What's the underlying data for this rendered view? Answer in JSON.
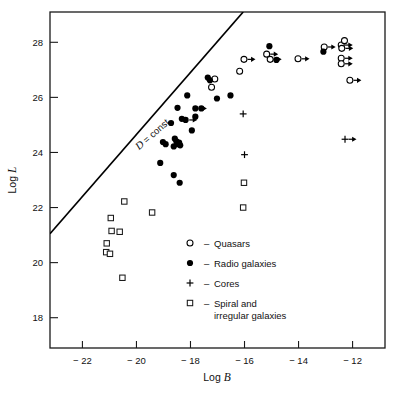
{
  "figure": {
    "background_color": "#ffffff",
    "ink_color": "#000000"
  },
  "chart_data": {
    "type": "scatter",
    "title": "",
    "subtitle": "",
    "xlabel": "Log B",
    "ylabel": "Log L",
    "xlim": [
      -23.2,
      -10.8
    ],
    "ylim": [
      16.9,
      29.1
    ],
    "grid": false,
    "xticks": [
      -22,
      -20,
      -18,
      -16,
      -14,
      -12
    ],
    "xtick_labels": [
      "− 22",
      "− 20",
      "− 18",
      "− 16",
      "− 14",
      "− 12"
    ],
    "yticks": [
      18,
      20,
      22,
      24,
      26,
      28
    ],
    "ytick_labels": [
      "18",
      "20",
      "22",
      "24",
      "26",
      "28"
    ],
    "legend_position": "center-bottom-inside",
    "annotations": [
      {
        "text": "D = const.",
        "text_italic_part": "D",
        "text_rest": "= const.",
        "rotation_deg": -41,
        "x": -19.3,
        "y": 24.6
      }
    ],
    "reference_line": {
      "label": "D = const.",
      "x_start": -23.2,
      "y_start": 21.05,
      "x_end": -16.05,
      "y_end": 29.1,
      "slope": 1.126
    },
    "legend": [
      {
        "key": "quasars",
        "marker": "open-circle",
        "dash": "–",
        "label": "Quasars"
      },
      {
        "key": "radio_galaxies",
        "marker": "filled-circle",
        "dash": "–",
        "label": "Radio galaxies"
      },
      {
        "key": "cores",
        "marker": "plus",
        "dash": "–",
        "label": "Cores"
      },
      {
        "key": "spiral_irregular",
        "marker": "open-square",
        "dash": "–",
        "label": "Spiral and",
        "label_line2": "irregular galaxies"
      }
    ],
    "series": [
      {
        "name": "Quasars",
        "marker": "open-circle",
        "points": [
          {
            "x": -16.18,
            "y": 26.95,
            "arrow": false
          },
          {
            "x": -17.1,
            "y": 26.67,
            "arrow": false
          },
          {
            "x": -17.22,
            "y": 26.37,
            "arrow": false
          },
          {
            "x": -15.18,
            "y": 27.57,
            "arrow": true
          },
          {
            "x": -15.05,
            "y": 27.38,
            "arrow": true
          },
          {
            "x": -16.02,
            "y": 27.38,
            "arrow": true
          },
          {
            "x": -14.02,
            "y": 27.4,
            "arrow": true
          },
          {
            "x": -13.05,
            "y": 27.83,
            "arrow": true
          },
          {
            "x": -12.42,
            "y": 27.9,
            "arrow": true
          },
          {
            "x": -12.3,
            "y": 28.06,
            "arrow": false
          },
          {
            "x": -12.4,
            "y": 27.78,
            "arrow": true
          },
          {
            "x": -12.42,
            "y": 27.42,
            "arrow": true
          },
          {
            "x": -12.42,
            "y": 27.22,
            "arrow": true
          },
          {
            "x": -12.1,
            "y": 26.62,
            "arrow": true
          }
        ]
      },
      {
        "name": "Radio galaxies",
        "marker": "filled-circle",
        "points": [
          {
            "x": -17.36,
            "y": 26.72,
            "arrow": false
          },
          {
            "x": -17.28,
            "y": 26.62,
            "arrow": false
          },
          {
            "x": -17.02,
            "y": 25.96,
            "arrow": false
          },
          {
            "x": -16.52,
            "y": 26.07,
            "arrow": false
          },
          {
            "x": -18.12,
            "y": 26.07,
            "arrow": false
          },
          {
            "x": -18.48,
            "y": 25.62,
            "arrow": false
          },
          {
            "x": -17.82,
            "y": 25.6,
            "arrow": true
          },
          {
            "x": -17.6,
            "y": 25.6,
            "arrow": false
          },
          {
            "x": -18.32,
            "y": 25.22,
            "arrow": false
          },
          {
            "x": -18.18,
            "y": 25.18,
            "arrow": true
          },
          {
            "x": -17.82,
            "y": 25.3,
            "arrow": false
          },
          {
            "x": -18.72,
            "y": 25.07,
            "arrow": false
          },
          {
            "x": -17.95,
            "y": 24.8,
            "arrow": false
          },
          {
            "x": -18.58,
            "y": 24.5,
            "arrow": false
          },
          {
            "x": -18.52,
            "y": 24.4,
            "arrow": false
          },
          {
            "x": -18.48,
            "y": 24.3,
            "arrow": false
          },
          {
            "x": -18.62,
            "y": 24.22,
            "arrow": false
          },
          {
            "x": -18.42,
            "y": 24.36,
            "arrow": false
          },
          {
            "x": -18.38,
            "y": 24.26,
            "arrow": false
          },
          {
            "x": -19.02,
            "y": 24.38,
            "arrow": false
          },
          {
            "x": -18.92,
            "y": 24.3,
            "arrow": false
          },
          {
            "x": -19.12,
            "y": 23.62,
            "arrow": false
          },
          {
            "x": -18.62,
            "y": 23.18,
            "arrow": false
          },
          {
            "x": -18.4,
            "y": 22.9,
            "arrow": false
          },
          {
            "x": -14.82,
            "y": 27.36,
            "arrow": false
          },
          {
            "x": -13.08,
            "y": 27.66,
            "arrow": false
          },
          {
            "x": -15.08,
            "y": 27.86,
            "arrow": false
          }
        ]
      },
      {
        "name": "Cores",
        "marker": "plus",
        "points": [
          {
            "x": -16.05,
            "y": 25.4,
            "arrow": false
          },
          {
            "x": -16.0,
            "y": 23.92,
            "arrow": false
          },
          {
            "x": -12.28,
            "y": 24.48,
            "arrow": true
          }
        ]
      },
      {
        "name": "Spiral and irregular galaxies",
        "marker": "open-square",
        "points": [
          {
            "x": -20.45,
            "y": 22.22,
            "arrow": false
          },
          {
            "x": -19.42,
            "y": 21.82,
            "arrow": false
          },
          {
            "x": -20.95,
            "y": 21.62,
            "arrow": false
          },
          {
            "x": -20.92,
            "y": 21.15,
            "arrow": false
          },
          {
            "x": -20.62,
            "y": 21.12,
            "arrow": false
          },
          {
            "x": -21.1,
            "y": 20.7,
            "arrow": false
          },
          {
            "x": -21.12,
            "y": 20.38,
            "arrow": false
          },
          {
            "x": -20.98,
            "y": 20.32,
            "arrow": false
          },
          {
            "x": -20.52,
            "y": 19.45,
            "arrow": false
          },
          {
            "x": -16.02,
            "y": 22.9,
            "arrow": false
          },
          {
            "x": -16.05,
            "y": 22.0,
            "arrow": false
          }
        ]
      }
    ]
  }
}
